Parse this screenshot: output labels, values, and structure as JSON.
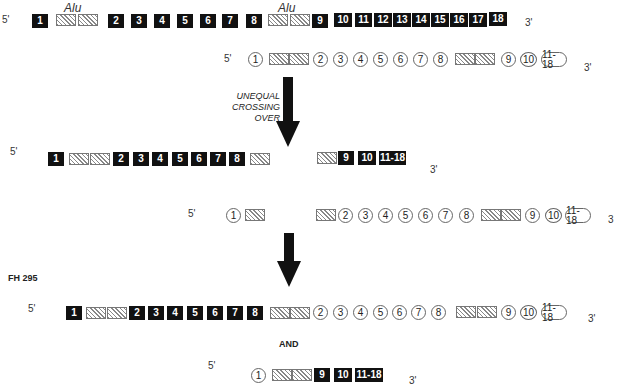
{
  "labels": {
    "five_prime": "5'",
    "three_prime": "3'",
    "three_trunc": "3",
    "alu": "Alu",
    "crossing_line1": "UNEQUAL",
    "crossing_line2": "CROSSING OVER",
    "fh": "FH 295",
    "and": "AND"
  },
  "exons": {
    "e1": "1",
    "e2": "2",
    "e3": "3",
    "e4": "4",
    "e5": "5",
    "e6": "6",
    "e7": "7",
    "e8": "8",
    "e9": "9",
    "e10": "10",
    "e11": "11",
    "e12": "12",
    "e13": "13",
    "e14": "14",
    "e15": "15",
    "e16": "16",
    "e17": "17",
    "e18": "18",
    "e11_18": "11-18"
  },
  "legend": {
    "filled_square": "normal allele exon",
    "open_circle": "homologous allele exon",
    "hatched": "Alu repeat"
  }
}
